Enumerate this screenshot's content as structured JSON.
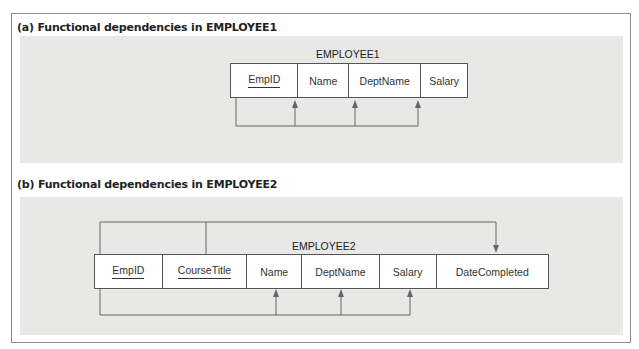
{
  "figures": [
    {
      "caption": "(a) Functional dependencies in EMPLOYEE1",
      "relation": {
        "name": "EMPLOYEE1",
        "attributes": [
          {
            "label": "EmpID",
            "primary_key": true
          },
          {
            "label": "Name",
            "primary_key": false
          },
          {
            "label": "DeptName",
            "primary_key": false
          },
          {
            "label": "Salary",
            "primary_key": false
          }
        ]
      },
      "dependencies": [
        {
          "from": [
            "EmpID"
          ],
          "to": [
            "Name",
            "DeptName",
            "Salary"
          ]
        }
      ]
    },
    {
      "caption": "(b) Functional dependencies in EMPLOYEE2",
      "relation": {
        "name": "EMPLOYEE2",
        "attributes": [
          {
            "label": "EmpID",
            "primary_key": true
          },
          {
            "label": "CourseTitle",
            "primary_key": true
          },
          {
            "label": "Name",
            "primary_key": false
          },
          {
            "label": "DeptName",
            "primary_key": false
          },
          {
            "label": "Salary",
            "primary_key": false
          },
          {
            "label": "DateCompleted",
            "primary_key": false
          }
        ]
      },
      "dependencies": [
        {
          "from": [
            "EmpID",
            "CourseTitle"
          ],
          "to": [
            "DateCompleted"
          ]
        },
        {
          "from": [
            "EmpID"
          ],
          "to": [
            "Name",
            "DeptName",
            "Salary"
          ]
        }
      ]
    }
  ],
  "colors": {
    "panel_bg": "#e8e8e6",
    "line": "#666666",
    "border": "#555555"
  }
}
